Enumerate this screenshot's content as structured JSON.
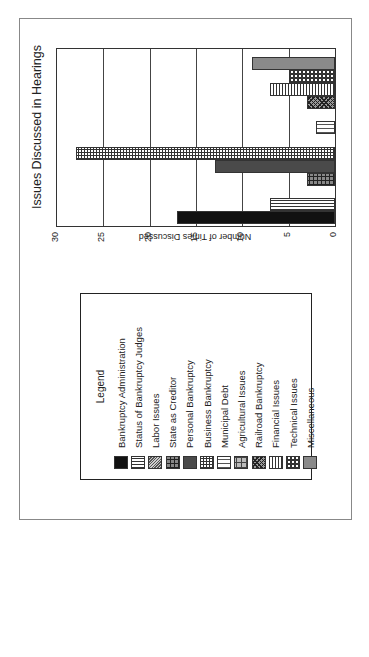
{
  "chart_data": {
    "type": "bar",
    "orientation": "vertical bars, whole figure rotated 90 degrees on the page",
    "title": "Issues Discussed in Hearings",
    "xlabel": "",
    "ylabel": "Number of Times Discussed",
    "ylim": [
      0,
      30
    ],
    "yticks": [
      0,
      5,
      10,
      15,
      20,
      25,
      30
    ],
    "grid": true,
    "legend_position": "separate box to the left",
    "categories": [
      "Bankruptcy Administration",
      "Status of Bankruptcy Judges",
      "Labor Issues",
      "State as Creditor",
      "Personal Bankruptcy",
      "Business Bankruptcy",
      "Municipal Debt",
      "Agricultural Issues",
      "Railroad Bankruptcy",
      "Financial Issues",
      "Technical Issues",
      "Miscellaneous"
    ],
    "values": [
      17,
      7,
      0,
      3,
      13,
      28,
      2,
      0,
      3,
      7,
      5,
      9
    ]
  },
  "title": "Issues Discussed in Hearings",
  "axis": {
    "label": "Number of Times Discussed",
    "ticks": [
      "0",
      "5",
      "10",
      "15",
      "20",
      "25",
      "30"
    ]
  },
  "legend": {
    "title": "Legend",
    "items": [
      {
        "label": "Bankruptcy Administration",
        "pattern": "p-black"
      },
      {
        "label": "Status of Bankruptcy Judges",
        "pattern": "p-vlines"
      },
      {
        "label": "Labor Issues",
        "pattern": "p-diag"
      },
      {
        "label": "State as Creditor",
        "pattern": "p-brick"
      },
      {
        "label": "Personal Bankruptcy",
        "pattern": "p-darkgray"
      },
      {
        "label": "Business Bankruptcy",
        "pattern": "p-grid"
      },
      {
        "label": "Municipal Debt",
        "pattern": "p-vlines-wide"
      },
      {
        "label": "Agricultural Issues",
        "pattern": "p-basket"
      },
      {
        "label": "Railroad Bankruptcy",
        "pattern": "p-check"
      },
      {
        "label": "Financial Issues",
        "pattern": "p-hlines"
      },
      {
        "label": "Technical Issues",
        "pattern": "p-circles"
      },
      {
        "label": "Miscellaneous",
        "pattern": "p-gray"
      }
    ]
  }
}
